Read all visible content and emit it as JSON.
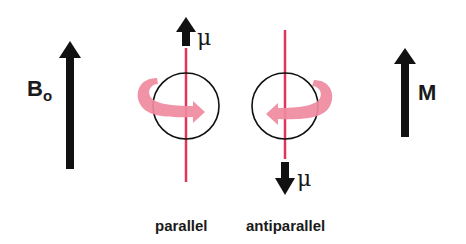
{
  "colors": {
    "arrow": "#111111",
    "axis": "#e0345a",
    "rotation": "#f08aa0",
    "circle": "#111111",
    "background": "#ffffff"
  },
  "field": {
    "label": "B",
    "subscript": "o"
  },
  "magnetization": {
    "label": "M"
  },
  "spins": [
    {
      "caption": "parallel",
      "moment_label": "μ",
      "moment_direction": "up",
      "rotation": "clockwise-front-right"
    },
    {
      "caption": "antiparallel",
      "moment_label": "μ",
      "moment_direction": "down",
      "rotation": "front-left"
    }
  ]
}
